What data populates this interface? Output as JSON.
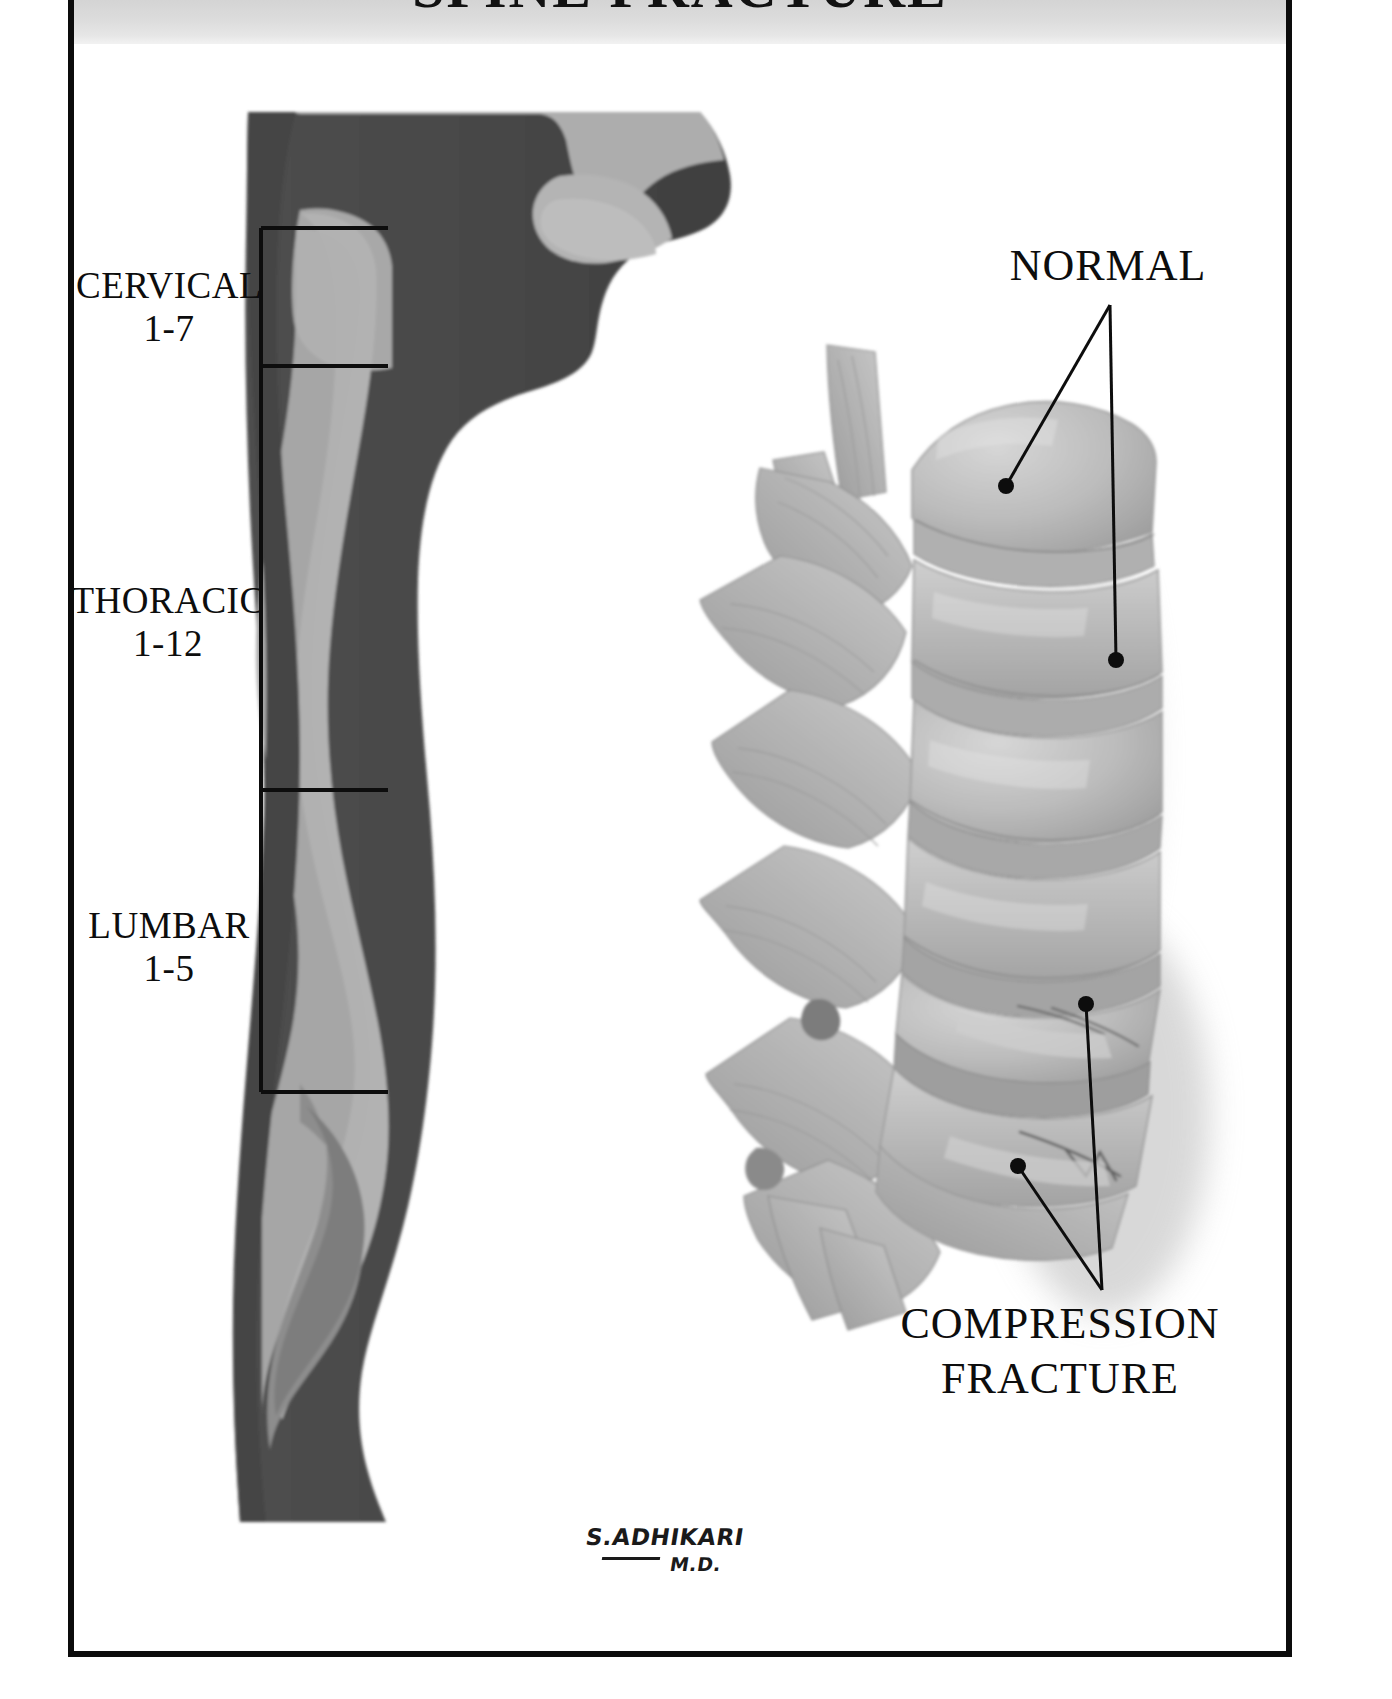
{
  "poster": {
    "title": "SPINE FRACTURE",
    "background_color": "#ffffff",
    "frame_color": "#0c0c0c",
    "header_band_color": "#dcdcdc"
  },
  "left_diagram": {
    "name": "lateral-body-profile-with-spinal-column",
    "body_color": "#4a4a4a",
    "skin_light_color": "#a9a9a9",
    "spine_band_color": "#b3b3b3",
    "regions": [
      {
        "label": "CERVICAL",
        "range": "1-7"
      },
      {
        "label": "THORACIC",
        "range": "1-12"
      },
      {
        "label": "LUMBAR",
        "range": "1-5"
      }
    ]
  },
  "right_diagram": {
    "name": "lumbar-vertebrae-lateral-view",
    "bone_color": "#b8b8b8",
    "shadow_color": "#c9c9c9",
    "callouts": [
      {
        "label": "NORMAL",
        "pointer_count": 2
      },
      {
        "label_line_1": "COMPRESSION",
        "label_line_2": "FRACTURE",
        "pointer_count": 2
      }
    ]
  },
  "signature": {
    "name": "S.ADHIKARI",
    "credential": "M.D."
  }
}
